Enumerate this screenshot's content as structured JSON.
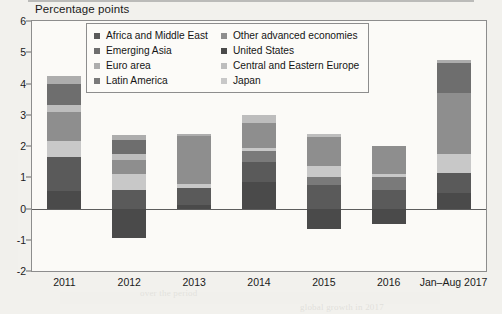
{
  "title": "Percentage points",
  "chart_data": {
    "type": "bar",
    "subtype": "stacked-bar",
    "title": "Percentage points",
    "xlabel": "",
    "ylabel": "Percentage points",
    "ylim": [
      -2,
      6
    ],
    "yticks": [
      6,
      5,
      4,
      3,
      2,
      1,
      0,
      -1,
      -2
    ],
    "ytick_labels": [
      "6",
      "5",
      "4",
      "3",
      "2",
      "1",
      "0",
      "-1",
      "-2"
    ],
    "grid": false,
    "zero_line": true,
    "legend_position": "top-center-inside",
    "categories": [
      "2011",
      "2012",
      "2013",
      "2014",
      "2015",
      "2016",
      "Jan–Aug 2017"
    ],
    "series": [
      {
        "name": "United States",
        "color": "#4a4a4a",
        "values": [
          0.55,
          -0.95,
          0.1,
          0.85,
          -0.65,
          -0.5,
          0.5
        ]
      },
      {
        "name": "Euro area",
        "color": "#adadad",
        "values": [
          0.25,
          0.15,
          0.08,
          0.0,
          0.0,
          0.0,
          0.1
        ]
      },
      {
        "name": "Emerging Asia",
        "color": "#6e6e6e",
        "values": [
          0.7,
          0.45,
          0.0,
          0.0,
          0.0,
          0.0,
          0.95
        ]
      },
      {
        "name": "Other advanced economies",
        "color": "#8e8e8e",
        "values": [
          0.95,
          0.45,
          1.55,
          0.8,
          0.95,
          0.9,
          1.95
        ]
      },
      {
        "name": "Central and Eastern Europe",
        "color": "#bdbdbd",
        "values": [
          0.2,
          0.2,
          0.0,
          0.25,
          0.1,
          0.0,
          0.0
        ]
      },
      {
        "name": "Africa and Middle East",
        "color": "#5a5a5a",
        "values": [
          1.1,
          0.6,
          0.55,
          0.65,
          0.75,
          0.6,
          0.65
        ]
      },
      {
        "name": "Latin America",
        "color": "#7a7a7a",
        "values": [
          0.0,
          0.0,
          0.0,
          0.35,
          0.25,
          0.4,
          0.0
        ]
      },
      {
        "name": "Japan",
        "color": "#c8c8c8",
        "values": [
          0.5,
          0.5,
          0.12,
          0.1,
          0.35,
          0.1,
          0.6
        ]
      }
    ],
    "bar_totals_positive": [
      4.35,
      2.35,
      2.4,
      3.0,
      2.4,
      2.0,
      4.85
    ],
    "bar_totals_negative": [
      0.0,
      -0.95,
      0.0,
      0.0,
      -0.65,
      -0.5,
      0.0
    ],
    "stack_order_bottom_to_top": [
      "United States",
      "Africa and Middle East",
      "Latin America",
      "Japan",
      "Other advanced economies",
      "Central and Eastern Europe",
      "Emerging Asia",
      "Euro area"
    ]
  },
  "legend": {
    "columns": [
      [
        {
          "label": "Africa and Middle East",
          "color": "#5a5a5a"
        },
        {
          "label": "Emerging Asia",
          "color": "#6e6e6e"
        },
        {
          "label": "Euro area",
          "color": "#adadad"
        },
        {
          "label": "Latin America",
          "color": "#7a7a7a"
        }
      ],
      [
        {
          "label": "Other advanced economies",
          "color": "#8e8e8e"
        },
        {
          "label": "United States",
          "color": "#4a4a4a"
        },
        {
          "label": "Central and Eastern Europe",
          "color": "#bdbdbd"
        },
        {
          "label": "Japan",
          "color": "#c8c8c8"
        }
      ]
    ]
  },
  "bleed_text": [
    {
      "text": "the reduction in global",
      "x": 120,
      "y": 34
    },
    {
      "text": "of the United States",
      "x": 118,
      "y": 62
    },
    {
      "text": "in the global economy",
      "x": 100,
      "y": 90
    },
    {
      "text": "emerging market",
      "x": 210,
      "y": 108
    },
    {
      "text": "advanced economies",
      "x": 112,
      "y": 134
    },
    {
      "text": "contribution to growth",
      "x": 160,
      "y": 160
    },
    {
      "text": "and the euro area",
      "x": 250,
      "y": 186
    },
    {
      "text": "has continued to",
      "x": 130,
      "y": 214
    },
    {
      "text": "remained broadly stable",
      "x": 230,
      "y": 240
    },
    {
      "text": "over the period",
      "x": 140,
      "y": 288
    },
    {
      "text": "global growth in 2017",
      "x": 300,
      "y": 302
    }
  ]
}
